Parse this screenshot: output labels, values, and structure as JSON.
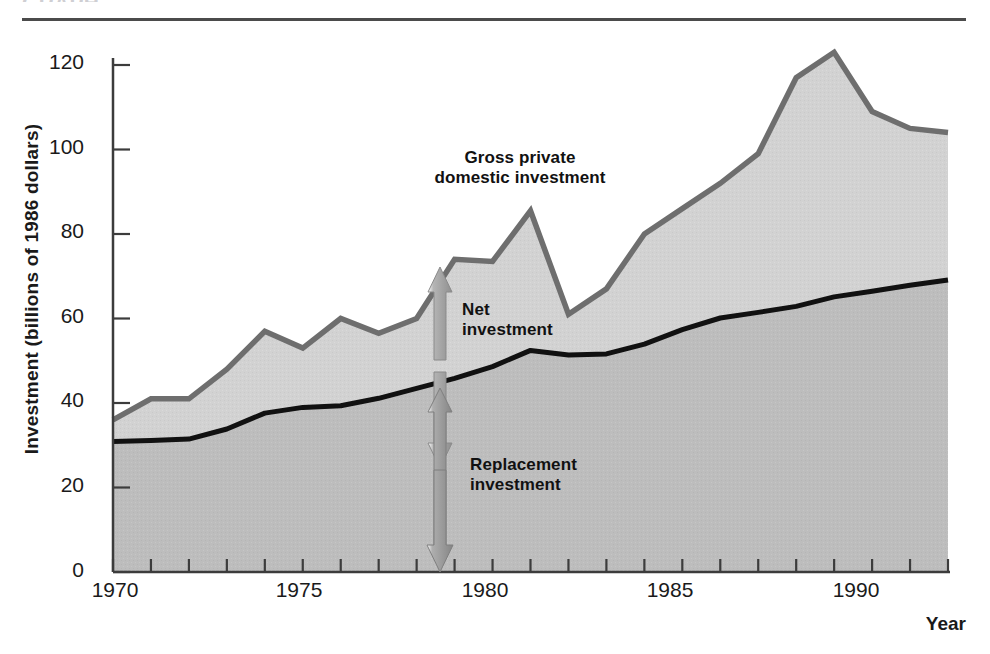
{
  "figure": {
    "cropped_heading": "GRAPH",
    "axes": {
      "y_title": "Investment (billions of 1986 dollars)",
      "x_title": "Year",
      "y_ticks": [
        0,
        20,
        40,
        60,
        80,
        100,
        120
      ],
      "x_ticks_labeled": [
        1970,
        1975,
        1980,
        1985,
        1990
      ]
    },
    "annotations": {
      "gross_line1": "Gross private",
      "gross_line2": "domestic investment",
      "net_line1": "Net",
      "net_line2": "investment",
      "replacement_line1": "Replacement",
      "replacement_line2": "investment"
    },
    "colors": {
      "gross_line": "#6e6e6e",
      "net_line": "#111111",
      "gross_fill": "#d2d2d2",
      "replacement_fill": "#bdbdbd",
      "arrow_net": "#9a9a9a",
      "arrow_replacement": "#8c8c8c",
      "axis": "#3c3c3c",
      "rule": "#4b4b4b",
      "text": "#1a1a1a"
    }
  },
  "chart_data": {
    "type": "area",
    "title": "Gross private domestic investment",
    "xlabel": "Year",
    "ylabel": "Investment (billions of 1986 dollars)",
    "xlim": [
      1970,
      1992
    ],
    "ylim": [
      0,
      130
    ],
    "ytick_values": [
      0,
      20,
      40,
      60,
      80,
      100,
      120
    ],
    "xtick_values": [
      1970,
      1971,
      1972,
      1973,
      1974,
      1975,
      1976,
      1977,
      1978,
      1979,
      1980,
      1981,
      1982,
      1983,
      1984,
      1985,
      1986,
      1987,
      1988,
      1989,
      1990,
      1991,
      1992
    ],
    "xtick_labels": [
      "1970",
      "",
      "",
      "",
      "",
      "1975",
      "",
      "",
      "",
      "",
      "1980",
      "",
      "",
      "",
      "",
      "1985",
      "",
      "",
      "",
      "",
      "1990",
      "",
      ""
    ],
    "grid": false,
    "legend_position": "inline-annotations",
    "x": [
      1970,
      1971,
      1972,
      1973,
      1974,
      1975,
      1976,
      1977,
      1978,
      1979,
      1980,
      1981,
      1982,
      1983,
      1984,
      1985,
      1986,
      1987,
      1988,
      1989,
      1990,
      1991,
      1992
    ],
    "series": [
      {
        "name": "Gross private domestic investment",
        "color": "#6e6e6e",
        "values": [
          36,
          41,
          41,
          48,
          57,
          53,
          60,
          56.5,
          60,
          74,
          73.5,
          85.5,
          61,
          67,
          80,
          86,
          92,
          99,
          117,
          123,
          109,
          105,
          104
        ]
      },
      {
        "name": "Replacement investment",
        "color": "#111111",
        "values": [
          31,
          31,
          31.5,
          34,
          37.5,
          39,
          39.5,
          41,
          43.5,
          46,
          48.5,
          52.5,
          51.5,
          51.5,
          54,
          57.5,
          60,
          61.5,
          63,
          65,
          66.5,
          68,
          69
        ]
      }
    ],
    "derived_series": [
      {
        "name": "Net investment",
        "description": "Gross private domestic investment minus replacement investment",
        "values": [
          5,
          10,
          9.5,
          14,
          19.5,
          14,
          20.5,
          15.5,
          16.5,
          28,
          25,
          33,
          9.5,
          15.5,
          26,
          28.5,
          32,
          37.5,
          54,
          58,
          42.5,
          37,
          35
        ]
      }
    ],
    "annotations": [
      {
        "text": "Gross private domestic investment",
        "at_year": 1982,
        "at_value": 100
      },
      {
        "text": "Net investment",
        "at_year": 1979.5,
        "at_value": 63,
        "marker": "double-arrow between lines at 1979"
      },
      {
        "text": "Replacement investment",
        "at_year": 1980,
        "at_value": 26,
        "marker": "double-arrow from 0 to replacement line at 1979"
      }
    ]
  }
}
